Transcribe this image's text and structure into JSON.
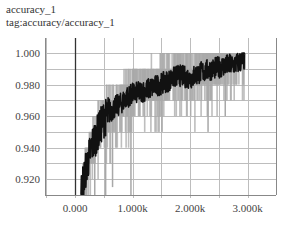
{
  "card": {
    "title": "accuracy_1",
    "tag": "tag:accuracy/accuracy_1"
  },
  "colors": {
    "raw_series": "#a8a8a8",
    "smoothed_series": "#111111",
    "grid": "#bdbdbd",
    "axis": "#333333"
  },
  "chart_data": {
    "type": "line",
    "title": "accuracy_1",
    "subtitle": "tag:accuracy/accuracy_1",
    "xlabel": "",
    "ylabel": "",
    "x_ticks": [
      "0.000",
      "1.000k",
      "2.000k",
      "3.000k"
    ],
    "y_ticks": [
      "0.920",
      "0.940",
      "0.960",
      "0.980",
      "1.000"
    ],
    "xlim": [
      -350,
      3700
    ],
    "ylim": [
      0.91,
      1.003
    ],
    "grid": true,
    "legend": null,
    "series": [
      {
        "name": "smoothed",
        "x": [
          100,
          200,
          300,
          400,
          500,
          600,
          700,
          800,
          900,
          1000,
          1200,
          1400,
          1600,
          1800,
          2000,
          2200,
          2400,
          2600,
          2800,
          2950
        ],
        "values": [
          0.912,
          0.928,
          0.942,
          0.95,
          0.958,
          0.962,
          0.966,
          0.968,
          0.972,
          0.974,
          0.976,
          0.979,
          0.982,
          0.986,
          0.984,
          0.988,
          0.99,
          0.992,
          0.993,
          0.996
        ]
      },
      {
        "name": "raw",
        "x": [
          100,
          200,
          300,
          400,
          500,
          600,
          700,
          800,
          900,
          1000,
          1200,
          1400,
          1600,
          1800,
          2000,
          2200,
          2400,
          2600,
          2800,
          2950
        ],
        "values": [
          0.91,
          0.93,
          0.94,
          0.96,
          0.98,
          0.97,
          0.98,
          0.99,
          0.97,
          0.98,
          0.99,
          1.0,
          0.98,
          1.0,
          0.99,
          1.0,
          0.98,
          1.0,
          1.0,
          1.0
        ]
      }
    ]
  }
}
